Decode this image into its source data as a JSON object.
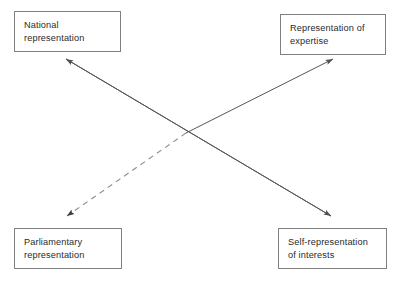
{
  "diagram": {
    "type": "four-node-crossing-arrow-diagram",
    "background_color": "#ffffff",
    "box_border_color": "#808080",
    "text_color": "#2b2b2b",
    "solid_line_color": "#555555",
    "dashed_line_color": "#8c8c8c",
    "nodes": [
      {
        "id": "national",
        "label": "National\nrepresentation",
        "position": "top-left"
      },
      {
        "id": "expertise",
        "label": "Representation of\nexpertise",
        "position": "top-right"
      },
      {
        "id": "parliamentary",
        "label": "Parliamentary\nrepresentation",
        "position": "bottom-left"
      },
      {
        "id": "selfrep",
        "label": "Self-representation\nof interests",
        "position": "bottom-right"
      }
    ],
    "connectors": [
      {
        "id": "national-selfrep",
        "style": "solid",
        "from": "national",
        "to": "selfrep",
        "arrowheads": "both"
      },
      {
        "id": "parliamentary-expertise",
        "style": "dashed-then-solid",
        "from": "parliamentary",
        "to": "expertise",
        "arrowheads": "both"
      }
    ]
  }
}
